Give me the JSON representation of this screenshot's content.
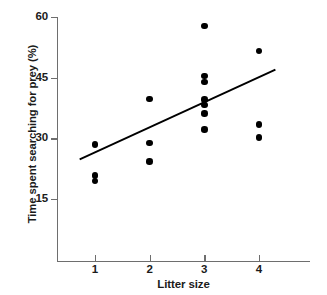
{
  "chart_data": {
    "type": "scatter",
    "title": "",
    "subtitle": "",
    "xlabel": "Litter size",
    "ylabel": "Time spent searching for prey (%)",
    "xlim": [
      0.2,
      4.8
    ],
    "ylim": [
      2,
      60
    ],
    "xticks": [
      1,
      2,
      3,
      4
    ],
    "xtick_labels": [
      "1",
      "2",
      "3",
      "4"
    ],
    "yticks": [
      15,
      30,
      45,
      60
    ],
    "ytick_labels": [
      "15",
      "30",
      "45",
      "60"
    ],
    "grid": false,
    "legend": null,
    "marker_color": "#000000",
    "axis_color": "#6e6e6e",
    "line_color": "#000000",
    "points": [
      {
        "x": 1,
        "y": 28.5
      },
      {
        "x": 1,
        "y": 20.8
      },
      {
        "x": 1,
        "y": 19.5
      },
      {
        "x": 2,
        "y": 39.8
      },
      {
        "x": 2,
        "y": 28.8
      },
      {
        "x": 2,
        "y": 24.3
      },
      {
        "x": 3,
        "y": 57.8
      },
      {
        "x": 3,
        "y": 45.4
      },
      {
        "x": 3,
        "y": 44.0
      },
      {
        "x": 3,
        "y": 39.6
      },
      {
        "x": 3,
        "y": 38.2
      },
      {
        "x": 3,
        "y": 36.1
      },
      {
        "x": 3,
        "y": 32.2
      },
      {
        "x": 4,
        "y": 51.6
      },
      {
        "x": 4,
        "y": 33.4
      },
      {
        "x": 4,
        "y": 30.2
      }
    ],
    "trend_line": {
      "type": "linear-regression",
      "x_start": 0.72,
      "y_start": 24.8,
      "x_end": 4.3,
      "y_end": 47.0
    }
  }
}
